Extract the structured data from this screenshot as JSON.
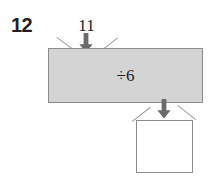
{
  "worksheet": {
    "question_number": "12",
    "input_value": "11",
    "operation": "÷6",
    "answer_value": "",
    "arrow_in_name": "down-arrow-icon",
    "arrow_out_name": "down-arrow-icon",
    "colors": {
      "machine_fill": "#d4d4d4",
      "machine_border": "#8c8c8c",
      "answer_box_fill": "#ffffff",
      "answer_box_border": "#8c8c8c",
      "arrow_fill": "#6b6b6b",
      "funnel_line": "#9a9a9a",
      "text": "#231f20",
      "page_background": "#ffffff"
    }
  }
}
